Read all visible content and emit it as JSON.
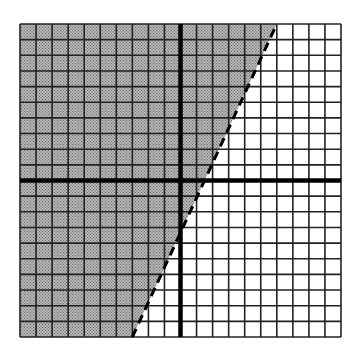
{
  "chart_data": {
    "type": "inequality-graph",
    "title": "",
    "grid": {
      "x_min": -10,
      "x_max": 10,
      "y_min": -10,
      "y_max": 10,
      "step": 1,
      "visible": true
    },
    "axes": {
      "x_axis": "y = 0",
      "y_axis": "x = 0",
      "tick_labels": []
    },
    "boundary_line": {
      "style": "dashed",
      "approx_equation": "y = 2.2x - 3",
      "points": [
        [
          -3,
          -10
        ],
        [
          6,
          10
        ]
      ]
    },
    "shaded_region": "left/above the boundary line (strict inequality, y > boundary)",
    "colors": {
      "shade": "#a9a9a9",
      "grid_line": "#222222",
      "axis": "#000000",
      "background": "#ffffff"
    }
  },
  "layout": {
    "left": 20,
    "top": 24,
    "right": 341,
    "bottom": 337,
    "origin_x": 181,
    "origin_y": 180
  }
}
